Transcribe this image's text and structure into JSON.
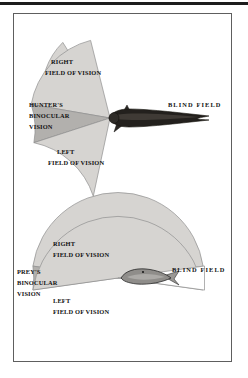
{
  "page": {
    "width": 248,
    "height": 378,
    "background_color": "#ffffff",
    "top_rule_color": "#1c1c1c",
    "frame_border_color": "#5e5e5e"
  },
  "palette": {
    "field_of_vision_fill": "#d6d4d1",
    "binocular_fill": "#b2b0ad",
    "sector_outline": "#8a8a8a",
    "hunter_body_dark": "#23201d",
    "hunter_body_mid": "#3c3934",
    "prey_body": "#8f8d8a",
    "prey_outline": "#2a2a2a",
    "label_text": "#111111",
    "blind_field_background": "#ffffff"
  },
  "diagrams": [
    {
      "id": "hunter-diagram",
      "name": "hunter-field-of-vision",
      "subject": "hunter-fish",
      "position": {
        "cx": 110,
        "cy": 118
      },
      "sectors": [
        {
          "name": "right-field-of-vision",
          "fill": "#d6d4d1",
          "start_deg": 103,
          "end_deg": 168,
          "radius": 78,
          "label_lines": [
            "RIGHT",
            "FIELD OF VISION"
          ]
        },
        {
          "name": "binocular-vision",
          "fill": "#b2b0ad",
          "start_deg": 168,
          "end_deg": 196,
          "radius": 78,
          "label_lines": [
            "HUNTER'S",
            "BINOCULAR",
            "VISION"
          ]
        },
        {
          "name": "left-field-of-vision",
          "fill": "#d6d4d1",
          "start_deg": 196,
          "end_deg": 258,
          "radius": 78,
          "label_lines": [
            "LEFT",
            "FIELD OF VISION"
          ]
        }
      ],
      "blind_field": {
        "name": "blind-field",
        "label": "BLIND  FIELD",
        "label_x": 163,
        "label_y": 104,
        "direction": "behind-and-to-the-rear"
      }
    },
    {
      "id": "prey-diagram",
      "name": "prey-field-of-vision",
      "subject": "prey-fish",
      "position": {
        "cx": 118,
        "cy": 278
      },
      "sectors": [
        {
          "name": "right-field-of-vision",
          "fill": "#d6d4d1",
          "start_deg": 8,
          "end_deg": 172,
          "radius": 84,
          "label_lines": [
            "RIGHT",
            "FIELD OF VISION"
          ]
        },
        {
          "name": "binocular-vision",
          "fill": "#b2b0ad",
          "start_deg": 172,
          "end_deg": 190,
          "radius": 84,
          "label_lines": [
            "PREY'S",
            "BINOCULAR",
            "VISION"
          ]
        },
        {
          "name": "left-field-of-vision",
          "fill": "#d6d4d1",
          "start_deg": 190,
          "end_deg": 352,
          "radius": 84,
          "label_lines": [
            "LEFT",
            "FIELD OF VISION"
          ]
        }
      ],
      "blind_field": {
        "name": "blind-field",
        "label": "BLIND  FIELD",
        "label_x": 168,
        "label_y": 268,
        "direction": "directly-behind"
      }
    }
  ],
  "labels": {
    "hunter": {
      "right_line1": "RIGHT",
      "right_line2": "FIELD OF VISION",
      "binocular_line1": "HUNTER'S",
      "binocular_line2": "BINOCULAR",
      "binocular_line3": "VISION",
      "left_line1": "LEFT",
      "left_line2": "FIELD OF VISION",
      "blind_field": "BLIND  FIELD"
    },
    "prey": {
      "right_line1": "RIGHT",
      "right_line2": "FIELD OF VISION",
      "binocular_line1": "PREY'S",
      "binocular_line2": "BINOCULAR",
      "binocular_line3": "VISION",
      "left_line1": "LEFT",
      "left_line2": "FIELD OF VISION",
      "blind_field": "BLIND  FIELD"
    }
  }
}
